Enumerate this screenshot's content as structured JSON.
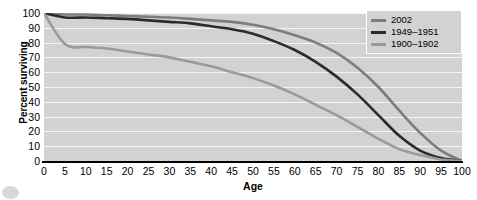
{
  "chart_data": {
    "type": "line",
    "title": "",
    "xlabel": "Age",
    "ylabel": "Percent surviving",
    "xlim": [
      0,
      100
    ],
    "ylim": [
      0,
      100
    ],
    "xticks": [
      0,
      5,
      10,
      15,
      20,
      25,
      30,
      35,
      40,
      45,
      50,
      55,
      60,
      65,
      70,
      75,
      80,
      85,
      90,
      95,
      100
    ],
    "yticks": [
      0,
      10,
      20,
      30,
      40,
      50,
      60,
      70,
      80,
      90,
      100
    ],
    "grid": "horizontal",
    "legend_position": "top-right",
    "x": [
      0,
      5,
      10,
      15,
      20,
      25,
      30,
      35,
      40,
      45,
      50,
      55,
      60,
      65,
      70,
      75,
      80,
      85,
      90,
      95,
      100
    ],
    "series": [
      {
        "name": "2002",
        "color": "#7d7d7d",
        "values": [
          100,
          99,
          99,
          98.5,
          98,
          97.5,
          97,
          96,
          95,
          94,
          92,
          89,
          85,
          80,
          73,
          63,
          50,
          34,
          19,
          7,
          0
        ]
      },
      {
        "name": "1949–1951",
        "color": "#2b2b2b",
        "values": [
          100,
          97,
          97,
          96.5,
          96,
          95,
          94,
          93,
          91,
          89,
          86,
          81,
          75,
          67,
          57,
          45,
          31,
          17,
          7,
          2,
          0
        ]
      },
      {
        "name": "1900–1902",
        "color": "#9a9a9a",
        "values": [
          100,
          79,
          77,
          76,
          74,
          72,
          70,
          67,
          64,
          60,
          56,
          51,
          45,
          38,
          31,
          23,
          15,
          8,
          4,
          1,
          0
        ]
      }
    ]
  },
  "legend": {
    "entries": [
      {
        "label": "2002",
        "color": "#7d7d7d"
      },
      {
        "label": "1949–1951",
        "color": "#2b2b2b"
      },
      {
        "label": "1900–1902",
        "color": "#9a9a9a"
      }
    ]
  },
  "axes": {
    "x_title": "Age",
    "y_title": "Percent surviving"
  },
  "colors": {
    "plot_background": "#d2d2d2",
    "gridline": "#f4f4f4",
    "axis": "#000000",
    "page_background": "#ffffff"
  }
}
